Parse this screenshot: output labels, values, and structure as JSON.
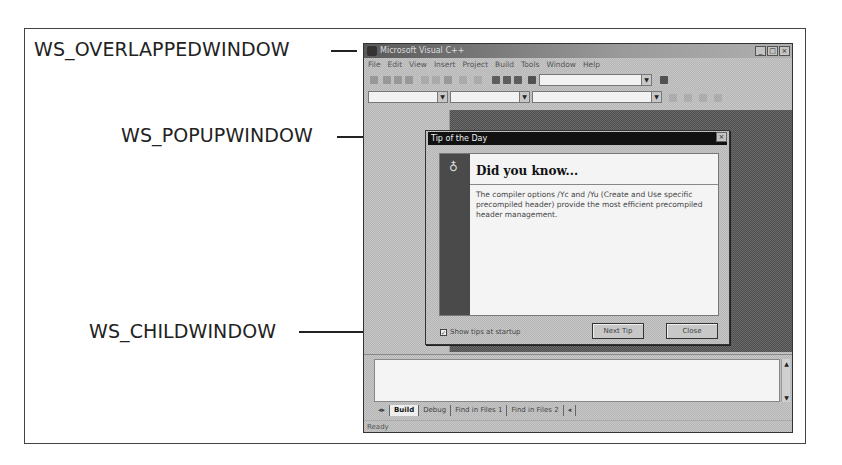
{
  "annotations": [
    {
      "id": "overlapped",
      "label": "WS_OVERLAPPEDWINDOW"
    },
    {
      "id": "popup",
      "label": "WS_POPUPWINDOW"
    },
    {
      "id": "child",
      "label": "WS_CHILDWINDOW"
    }
  ],
  "app_window": {
    "title": "Microsoft Visual C++",
    "title_buttons": {
      "minimize": "_",
      "maximize": "□",
      "close": "×"
    },
    "menu": [
      "File",
      "Edit",
      "View",
      "Insert",
      "Project",
      "Build",
      "Tools",
      "Window",
      "Help"
    ],
    "output": {
      "tabs": [
        "Build",
        "Debug",
        "Find in Files 1",
        "Find in Files 2"
      ],
      "active_tab": "Build"
    },
    "status": "Ready"
  },
  "dialog": {
    "title": "Tip of the Day",
    "heading": "Did you know...",
    "tip": "The compiler options /Yc and /Yu (Create and Use specific precompiled header) provide the most efficient precompiled header management.",
    "checkbox_label": "Show tips at startup",
    "checkbox_checked": true,
    "next_button": "Next Tip",
    "close_button": "Close"
  }
}
